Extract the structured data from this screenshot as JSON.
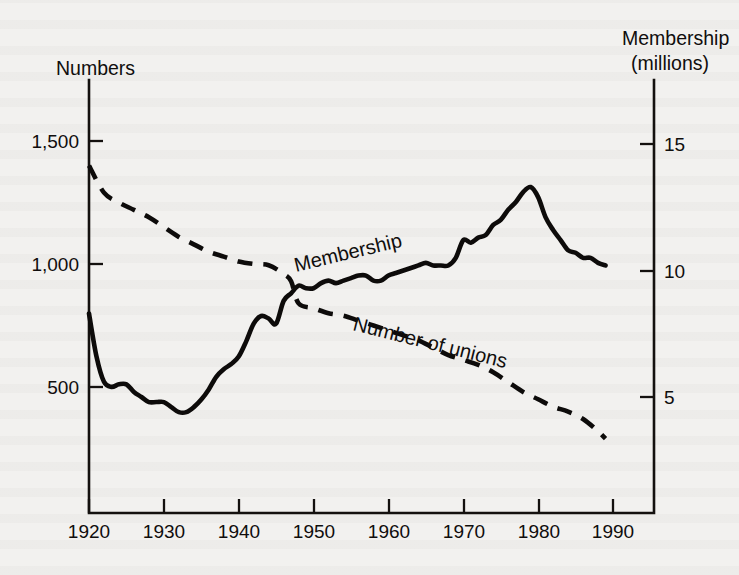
{
  "chart_data": {
    "type": "line",
    "title": "",
    "xlabel": "",
    "ylabel": "Numbers",
    "ylabel_right": "Membership (millions)",
    "grid": false,
    "legend_position": "inline-labels",
    "xlim": [
      1920,
      1990
    ],
    "xticks": [
      1920,
      1930,
      1940,
      1950,
      1960,
      1970,
      1980,
      1990
    ],
    "xticklabels": [
      "1920",
      "1930",
      "1940",
      "1950",
      "1960",
      "1970",
      "1980",
      "1990"
    ],
    "ylim_left": [
      0,
      1600
    ],
    "yticks_left": [
      500,
      1000,
      1500
    ],
    "yticklabels_left": [
      "500",
      "1,000",
      "1,500"
    ],
    "ylim_right": [
      0,
      16.2
    ],
    "yticks_right": [
      5,
      10,
      15
    ],
    "yticklabels_right": [
      "5",
      "10",
      "15"
    ],
    "series": [
      {
        "name": "Membership",
        "label": "Membership",
        "axis": "right",
        "units": "millions",
        "style": "solid",
        "color": "#0d0b0a",
        "x": [
          1920,
          1921,
          1922,
          1923,
          1924,
          1925,
          1926,
          1927,
          1928,
          1929,
          1930,
          1931,
          1932,
          1933,
          1934,
          1935,
          1936,
          1937,
          1938,
          1939,
          1940,
          1941,
          1942,
          1943,
          1944,
          1945,
          1946,
          1947,
          1948,
          1949,
          1950,
          1951,
          1952,
          1953,
          1954,
          1955,
          1956,
          1957,
          1958,
          1959,
          1960,
          1961,
          1962,
          1963,
          1964,
          1965,
          1966,
          1967,
          1968,
          1969,
          1970,
          1971,
          1972,
          1973,
          1974,
          1975,
          1976,
          1977,
          1978,
          1979,
          1980,
          1981,
          1982,
          1983,
          1984,
          1985,
          1986,
          1987,
          1988,
          1989
        ],
        "y": [
          8.3,
          6.6,
          5.6,
          5.4,
          5.5,
          5.5,
          5.2,
          5.0,
          4.8,
          4.8,
          4.8,
          4.6,
          4.4,
          4.4,
          4.6,
          4.9,
          5.3,
          5.8,
          6.1,
          6.3,
          6.6,
          7.2,
          7.9,
          8.2,
          8.1,
          7.9,
          8.8,
          9.1,
          9.4,
          9.3,
          9.3,
          9.5,
          9.6,
          9.5,
          9.6,
          9.7,
          9.8,
          9.8,
          9.6,
          9.6,
          9.8,
          9.9,
          10.0,
          10.1,
          10.2,
          10.3,
          10.2,
          10.2,
          10.2,
          10.5,
          11.2,
          11.1,
          11.3,
          11.4,
          11.8,
          12.0,
          12.4,
          12.7,
          13.1,
          13.3,
          12.9,
          12.1,
          11.6,
          11.2,
          10.8,
          10.7,
          10.5,
          10.5,
          10.3,
          10.2
        ]
      },
      {
        "name": "Number of unions",
        "label": "Number of unions",
        "axis": "left",
        "units": "count",
        "style": "dashed",
        "color": "#0d0b0a",
        "x": [
          1920,
          1922,
          1924,
          1926,
          1928,
          1930,
          1932,
          1934,
          1936,
          1938,
          1940,
          1942,
          1944,
          1946,
          1947,
          1948,
          1950,
          1952,
          1954,
          1956,
          1958,
          1960,
          1962,
          1964,
          1966,
          1968,
          1970,
          1972,
          1974,
          1976,
          1978,
          1980,
          1982,
          1984,
          1986,
          1988,
          1989
        ],
        "y": [
          1400,
          1290,
          1250,
          1220,
          1190,
          1150,
          1110,
          1080,
          1050,
          1030,
          1010,
          1000,
          995,
          960,
          930,
          840,
          820,
          800,
          790,
          770,
          750,
          730,
          710,
          690,
          660,
          630,
          610,
          590,
          560,
          520,
          480,
          450,
          420,
          400,
          370,
          320,
          290
        ]
      }
    ]
  },
  "axes": {
    "left_title": "Numbers",
    "right_title_line1": "Membership",
    "right_title_line2": "(millions)"
  },
  "annotations": {
    "membership_label": "Membership",
    "unions_label": "Number of unions"
  },
  "colors": {
    "ink": "#0d0b0a",
    "paper": "#f2f1ef"
  }
}
